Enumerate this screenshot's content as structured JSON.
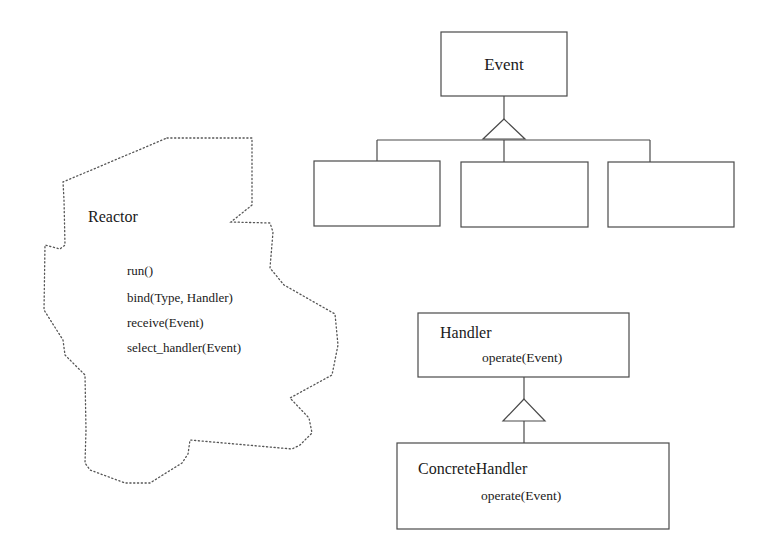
{
  "diagram": {
    "type": "uml-class-diagram",
    "colors": {
      "line": "#4a4a4a",
      "text": "#1a1a1a",
      "cloud_dots": "#555555"
    },
    "reactor": {
      "name": "Reactor",
      "shape": "cloud (dotted outline)",
      "operations": [
        "run()",
        "bind(Type, Handler)",
        "receive(Event)",
        "select_handler(Event)"
      ]
    },
    "event_hierarchy": {
      "parent": {
        "name": "Event"
      },
      "children": [
        {
          "name": ""
        },
        {
          "name": ""
        },
        {
          "name": ""
        }
      ],
      "relation": "generalization"
    },
    "handler_hierarchy": {
      "parent": {
        "name": "Handler",
        "operation": "operate(Event)"
      },
      "child": {
        "name": "ConcreteHandler",
        "operation": "operate(Event)"
      },
      "relation": "generalization"
    }
  }
}
